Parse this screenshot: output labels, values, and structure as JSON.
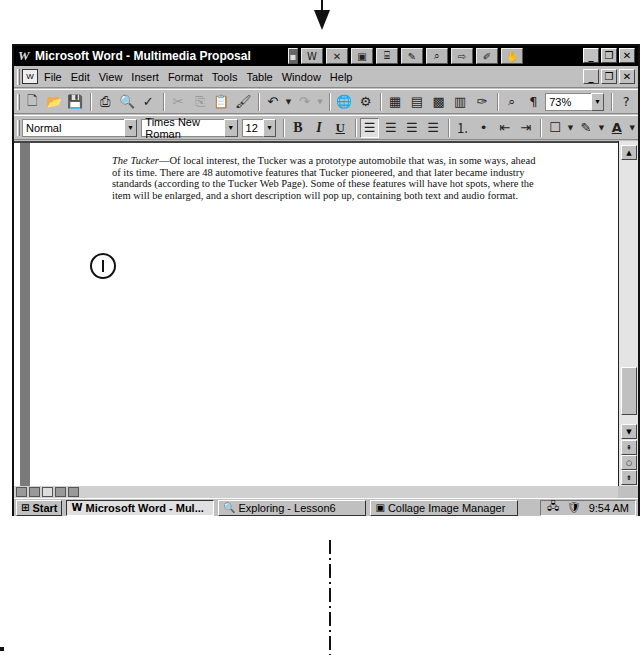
{
  "window": {
    "title": "Microsoft Word - Multimedia Proposal",
    "app_icon": "W",
    "office_bar_icons": [
      "word-icon",
      "excel-icon",
      "powerpoint-icon",
      "access-icon",
      "schedule-icon",
      "find-icon",
      "binder-icon",
      "answer-wizard-icon",
      "office-assistant-icon"
    ],
    "controls": [
      "_",
      "🗗",
      "✕"
    ]
  },
  "menubar": {
    "items": [
      {
        "label": "File",
        "accel": "F"
      },
      {
        "label": "Edit",
        "accel": "E"
      },
      {
        "label": "View",
        "accel": "V"
      },
      {
        "label": "Insert",
        "accel": "I"
      },
      {
        "label": "Format",
        "accel": "o"
      },
      {
        "label": "Tools",
        "accel": "T"
      },
      {
        "label": "Table",
        "accel": "a"
      },
      {
        "label": "Window",
        "accel": "W"
      },
      {
        "label": "Help",
        "accel": "H"
      }
    ]
  },
  "standard_toolbar": {
    "zoom_value": "73%",
    "buttons": [
      "new",
      "open",
      "save",
      "print",
      "print-preview",
      "spelling",
      "cut",
      "copy",
      "paste",
      "format-painter",
      "undo",
      "redo",
      "insert-hyperlink",
      "web-toolbar",
      "tables-borders",
      "insert-table",
      "insert-excel",
      "columns",
      "drawing",
      "document-map",
      "show-hide",
      "help"
    ]
  },
  "formatting_toolbar": {
    "style": "Normal",
    "font": "Times New Roman",
    "size": "12",
    "bold": "B",
    "italic": "I",
    "underline": "U"
  },
  "document": {
    "lead": "The Tucker",
    "body": "—Of local interest, the Tucker was a prototype automobile that was, in some ways, ahead of its time. There are 48 automotive features that Tucker pioneered, and that later became industry standards (according to the Tucker Web Page). Some of these features will have hot spots, where the item will be enlarged, and a short description will pop up, containing both text and audio format."
  },
  "taskbar": {
    "start_label": "Start",
    "tasks": [
      {
        "label": "Microsoft Word - Mul...",
        "active": true
      },
      {
        "label": "Exploring - Lesson6",
        "active": false
      },
      {
        "label": "Collage Image Manager",
        "active": false
      }
    ],
    "clock": "9:54 AM"
  }
}
